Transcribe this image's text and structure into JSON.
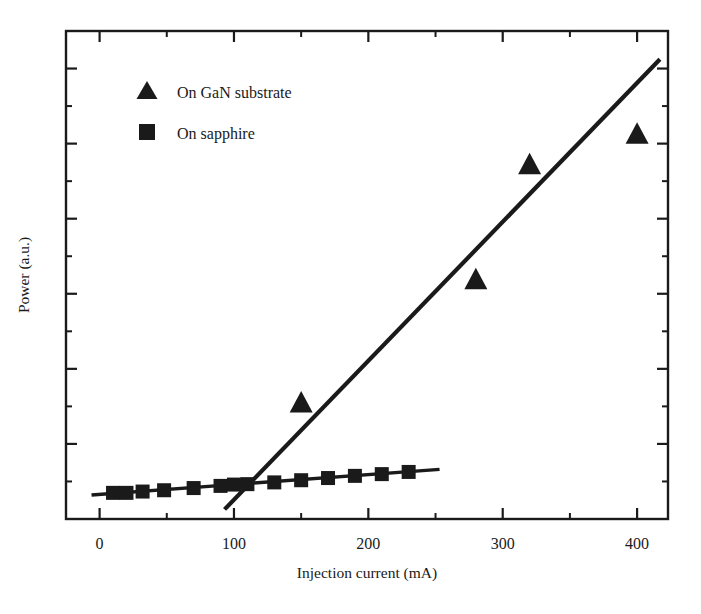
{
  "chart_data": {
    "type": "scatter",
    "title": "",
    "xlabel": "Injection current (mA)",
    "ylabel": "Power (a.u.)",
    "xlim": [
      -25,
      423
    ],
    "ylim": [
      0,
      1.12
    ],
    "grid": false,
    "legend_position": "upper-left",
    "x_ticks_major": [
      0,
      100,
      200,
      300,
      400
    ],
    "x_ticks_major_labels": [
      "0",
      "100",
      "200",
      "300",
      "400"
    ],
    "x_ticks_minor": [
      50,
      150,
      250,
      350
    ],
    "y_ticks_major_count": 6,
    "y_ticks_minor_count": 6,
    "y_tick_labels": [],
    "series": [
      {
        "name": "On GaN substrate",
        "marker": "triangle",
        "color": "#1a1a1a",
        "x": [
          150,
          280,
          320,
          400
        ],
        "y": [
          0.265,
          0.548,
          0.812,
          0.882
        ],
        "fit_line": {
          "x0": 93,
          "y0": 0.022,
          "x1": 417,
          "y1": 1.055
        }
      },
      {
        "name": "On sapphire",
        "marker": "square",
        "color": "#1a1a1a",
        "x": [
          10,
          20,
          32,
          48,
          70,
          90,
          100,
          110,
          130,
          150,
          170,
          190,
          210,
          230
        ],
        "y": [
          0.06,
          0.06,
          0.063,
          0.066,
          0.071,
          0.076,
          0.079,
          0.08,
          0.084,
          0.089,
          0.094,
          0.099,
          0.103,
          0.108
        ],
        "fit_line": {
          "x0": -6,
          "y0": 0.055,
          "x1": 253,
          "y1": 0.114
        }
      }
    ]
  },
  "legend": {
    "entries": [
      {
        "label": "On GaN substrate",
        "marker": "triangle"
      },
      {
        "label": "On sapphire",
        "marker": "square"
      }
    ]
  },
  "axes": {
    "x_title": "Injection current (mA)",
    "y_title": "Power (a.u.)"
  }
}
